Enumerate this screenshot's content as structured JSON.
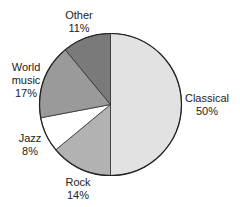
{
  "chart_data": {
    "type": "pie",
    "title": "",
    "categories": [
      "Classical",
      "Rock",
      "Jazz",
      "World music",
      "Other"
    ],
    "values": [
      50,
      14,
      8,
      17,
      11
    ],
    "unit": "%",
    "start_angle": "12 o'clock",
    "direction": "clockwise",
    "colors": [
      "#e2e2e2",
      "#b2b2b2",
      "#ffffff",
      "#9a9a9a",
      "#7a7a7a"
    ],
    "legend": "none (direct labels)",
    "labels": [
      {
        "line1": "Classical",
        "line2": "",
        "pct": "50%"
      },
      {
        "line1": "Rock",
        "line2": "",
        "pct": "14%"
      },
      {
        "line1": "Jazz",
        "line2": "",
        "pct": "8%"
      },
      {
        "line1": "World",
        "line2": "music",
        "pct": "17%"
      },
      {
        "line1": "Other",
        "line2": "",
        "pct": "11%"
      }
    ]
  }
}
